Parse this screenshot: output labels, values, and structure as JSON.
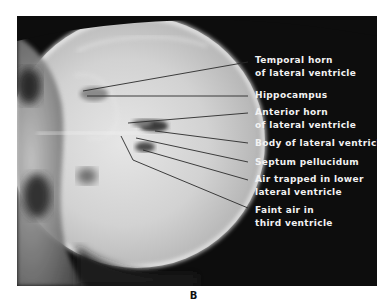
{
  "figure": {
    "panel_label": "B",
    "image_description": "Lateral skull radiograph (pneumoencephalogram) with air outlining the ventricles",
    "labels": [
      {
        "id": "temporal-horn",
        "lines": [
          "Temporal horn",
          "of lateral ventricle"
        ]
      },
      {
        "id": "hippocampus",
        "lines": [
          "Hippocampus"
        ]
      },
      {
        "id": "anterior-horn",
        "lines": [
          "Anterior horn",
          "of lateral ventricle"
        ]
      },
      {
        "id": "body-lateral-ventricle",
        "lines": [
          "Body of lateral ventricle"
        ]
      },
      {
        "id": "septum-pellucidum",
        "lines": [
          "Septum pellucidum"
        ]
      },
      {
        "id": "air-trapped",
        "lines": [
          "Air trapped in lower",
          "lateral ventricle"
        ]
      },
      {
        "id": "faint-air-third-ventricle",
        "lines": [
          "Faint air in",
          "third ventricle"
        ]
      }
    ]
  },
  "colors": {
    "background": "#0d0d0d",
    "label_text": "#f2f2f2",
    "leader_line": "#2a2a2a",
    "caption_text": "#111111"
  }
}
